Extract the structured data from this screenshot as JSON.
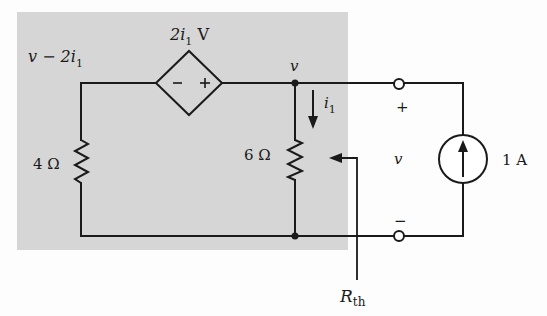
{
  "diagram": {
    "type": "circuit",
    "shaded_region": {
      "x": 17,
      "y": 12,
      "width": 331,
      "height": 238,
      "color": "#d6d6d6"
    },
    "wire_color": "#1a1a1a",
    "labels": {
      "left_node_voltage": "v − 2i",
      "left_node_voltage_sub": "1",
      "dependent_source_value": "2i",
      "dependent_source_sub": "1",
      "dependent_source_unit": " V",
      "dependent_source_minus": "−",
      "dependent_source_plus": "+",
      "node_voltage": "v",
      "branch_current": "i",
      "branch_current_sub": "1",
      "resistor_left": "4 Ω",
      "resistor_right": "6 Ω",
      "terminal_plus": "+",
      "terminal_voltage": "v",
      "terminal_minus": "−",
      "current_source": "1 A",
      "thevenin_label": "R",
      "thevenin_sub": "th"
    },
    "components": [
      {
        "id": "dependent-voltage-source",
        "kind": "CCVS",
        "value": "2i1 V",
        "polarity": "- left, + right"
      },
      {
        "id": "resistor-4ohm",
        "kind": "resistor",
        "value": "4 Ω"
      },
      {
        "id": "resistor-6ohm",
        "kind": "resistor",
        "value": "6 Ω"
      },
      {
        "id": "current-source-1A",
        "kind": "independent current source",
        "value": "1 A",
        "direction": "up"
      },
      {
        "id": "terminal-top",
        "kind": "terminal"
      },
      {
        "id": "terminal-bottom",
        "kind": "terminal"
      }
    ]
  }
}
